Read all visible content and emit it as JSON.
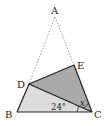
{
  "figure": {
    "points": {
      "A": "A",
      "B": "B",
      "C": "C",
      "D": "D",
      "E": "E"
    },
    "angles": {
      "known": "24°",
      "unknown": "x"
    },
    "colors": {
      "light_fill": "#dcdcdc",
      "dark_fill": "#a9a9a9",
      "stroke": "#222222",
      "dashed": "#888888"
    }
  }
}
